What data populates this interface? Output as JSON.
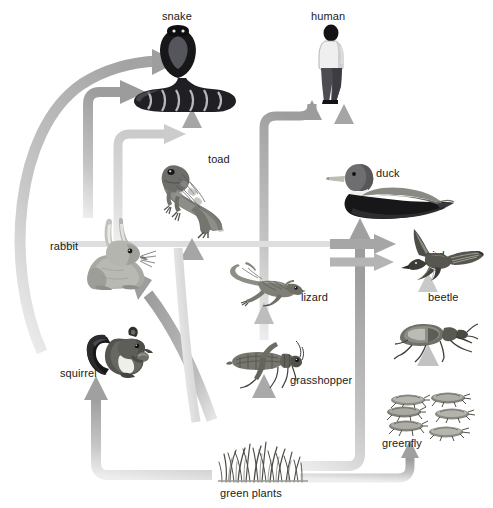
{
  "diagram": {
    "type": "food-web",
    "background_color": "#ffffff",
    "arrow_colors": {
      "dark": "#9a9a9a",
      "mid": "#b3b3b3",
      "light": "#cfcfcf",
      "pale": "#dcdcdc"
    },
    "label_color": "#1a1a1a"
  },
  "organisms": [
    {
      "id": "snake",
      "label": "snake",
      "trophic": "tertiary-consumer",
      "label_x": 162,
      "label_y": 10,
      "art_x": 128,
      "art_y": 24,
      "art_w": 112,
      "art_h": 88
    },
    {
      "id": "human",
      "label": "human",
      "trophic": "tertiary-consumer",
      "label_x": 311,
      "label_y": 10,
      "art_x": 312,
      "art_y": 24,
      "art_w": 40,
      "art_h": 80
    },
    {
      "id": "toad",
      "label": "toad",
      "trophic": "secondary-consumer",
      "label_x": 208,
      "label_y": 153,
      "art_x": 160,
      "art_y": 160,
      "art_w": 70,
      "art_h": 78
    },
    {
      "id": "duck",
      "label": "duck",
      "trophic": "secondary-consumer",
      "label_x": 376,
      "label_y": 167,
      "art_x": 325,
      "art_y": 158,
      "art_w": 130,
      "art_h": 62
    },
    {
      "id": "rabbit",
      "label": "rabbit",
      "trophic": "primary-consumer",
      "label_x": 50,
      "label_y": 240,
      "art_x": 78,
      "art_y": 218,
      "art_w": 78,
      "art_h": 72
    },
    {
      "id": "bird",
      "label": "bird",
      "trophic": "tertiary-consumer",
      "label_x": 426,
      "label_y": 249,
      "art_x": 389,
      "art_y": 227,
      "art_w": 96,
      "art_h": 54
    },
    {
      "id": "lizard",
      "label": "lizard",
      "trophic": "secondary-consumer",
      "label_x": 301,
      "label_y": 291,
      "art_x": 228,
      "art_y": 258,
      "art_w": 78,
      "art_h": 48
    },
    {
      "id": "beetle",
      "label": "beetle",
      "trophic": "secondary-consumer",
      "label_x": 428,
      "label_y": 291,
      "art_x": 392,
      "art_y": 312,
      "art_w": 86,
      "art_h": 50
    },
    {
      "id": "squirrel",
      "label": "squirrel",
      "trophic": "primary-consumer",
      "label_x": 60,
      "label_y": 367,
      "art_x": 85,
      "art_y": 313,
      "art_w": 74,
      "art_h": 66
    },
    {
      "id": "grasshopper",
      "label": "grasshopper",
      "trophic": "primary-consumer",
      "label_x": 290,
      "label_y": 374,
      "art_x": 226,
      "art_y": 340,
      "art_w": 78,
      "art_h": 48
    },
    {
      "id": "greenfly",
      "label": "greenfly",
      "trophic": "primary-consumer",
      "label_x": 382,
      "label_y": 437,
      "art_x": 386,
      "art_y": 392,
      "art_w": 92,
      "art_h": 52
    },
    {
      "id": "green-plants",
      "label": "green plants",
      "trophic": "producer",
      "label_x": 220,
      "label_y": 487,
      "art_x": 218,
      "art_y": 432,
      "art_w": 90,
      "art_h": 50
    }
  ],
  "links": [
    {
      "from": "squirrel",
      "to": "snake",
      "style": "curve-long-left"
    },
    {
      "from": "rabbit",
      "to": "snake",
      "style": "elbow-up-right"
    },
    {
      "from": "toad",
      "to": "snake",
      "style": "straight-up"
    },
    {
      "from": "lizard",
      "to": "snake",
      "style": "elbow-up-right"
    },
    {
      "from": "duck",
      "to": "human",
      "style": "straight-up"
    },
    {
      "from": "grasshopper",
      "to": "human",
      "style": "elbow-right-up"
    },
    {
      "from": "grasshopper",
      "to": "toad",
      "style": "straight-up"
    },
    {
      "from": "green-plants",
      "to": "duck",
      "style": "elbow-up"
    },
    {
      "from": "greenfly",
      "to": "bird",
      "style": "horizontal-right"
    },
    {
      "from": "beetle",
      "to": "bird",
      "style": "straight-up"
    },
    {
      "from": "greenfly",
      "to": "beetle",
      "style": "straight-up"
    },
    {
      "from": "green-plants",
      "to": "greenfly",
      "style": "elbow-right-up"
    },
    {
      "from": "green-plants",
      "to": "grasshopper",
      "style": "straight-up"
    },
    {
      "from": "green-plants",
      "to": "lizard",
      "style": "straight-up"
    },
    {
      "from": "green-plants",
      "to": "rabbit",
      "style": "diagonal-up-left"
    },
    {
      "from": "green-plants",
      "to": "squirrel",
      "style": "elbow-left-up"
    }
  ]
}
